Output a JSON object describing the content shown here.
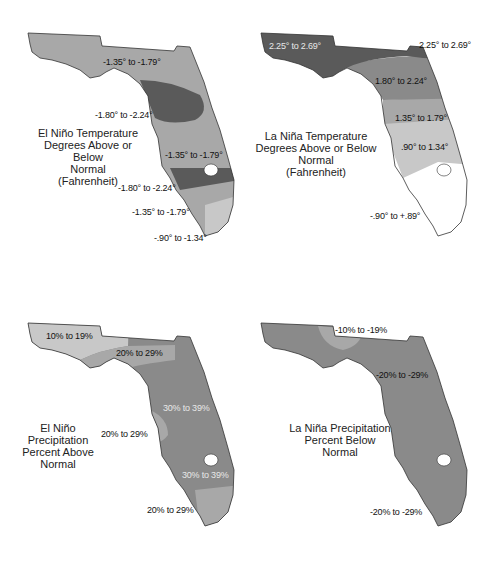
{
  "colors": {
    "light": "#c8c8c8",
    "medium": "#a8a8a8",
    "mediumdark": "#8a8a8a",
    "dark": "#5a5a5a",
    "white": "#ffffff",
    "outline": "#333333"
  },
  "panels": [
    {
      "title_lines": [
        "El Niño Temperature",
        "Degrees Above or Below",
        "Normal",
        "(Fahrenheit)"
      ],
      "labels": [
        "-1.35° to -1.79°",
        "-1.80° to -2.24°",
        "-1.35° to -1.79°",
        "-1.80° to -2.24°",
        "-1.35° to -1.79°",
        "-.90° to -1.34°"
      ]
    },
    {
      "title_lines": [
        "La Niña Temperature",
        "Degrees Above or Below",
        "Normal",
        "(Fahrenheit)"
      ],
      "labels": [
        "2.25° to 2.69°",
        "2.25° to 2.69°",
        "1.80° to 2.24°",
        "1.35° to 1.79°",
        ".90° to 1.34°",
        "-.90° to +.89°"
      ]
    },
    {
      "title_lines": [
        "El Niño",
        "Precipitation",
        "Percent Above",
        "Normal"
      ],
      "labels": [
        "10% to 19%",
        "20% to 29%",
        "30% to 39%",
        "20% to 29%",
        "30% to 39%",
        "20% to 29%"
      ]
    },
    {
      "title_lines": [
        "La Niña Precipitation",
        "Percent Below",
        "Normal"
      ],
      "labels": [
        "-10% to -19%",
        "-20% to -29%",
        "-20% to -29%"
      ]
    }
  ]
}
